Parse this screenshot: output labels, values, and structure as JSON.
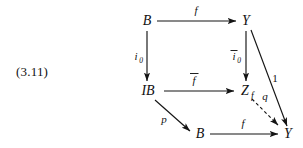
{
  "figure": {
    "equation_number": "(3.11)",
    "kind": "commutative-diagram",
    "nodes": {
      "top_left": "B",
      "top_right": "Y",
      "mid_left": "IB",
      "mid_right_base": "Z",
      "mid_right_sub": "f",
      "bottom_left": "B",
      "bottom_right": "Y"
    },
    "arrows": {
      "top_horizontal": "f",
      "left_vertical_base": "i",
      "left_vertical_sub": "0",
      "right_vertical_base": "i",
      "right_vertical_sub": "0",
      "middle_horizontal": "f",
      "diagonal_p": "p",
      "bottom_horizontal": "f",
      "identity": "1",
      "dashed_q": "q"
    },
    "colors": {
      "ink": "#141414",
      "background": "#ffffff"
    }
  }
}
